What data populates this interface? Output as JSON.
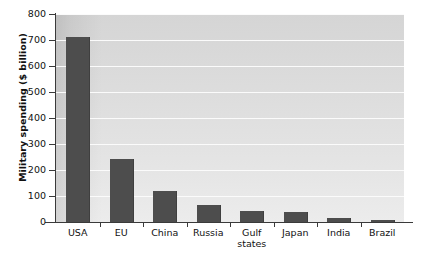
{
  "chart_data": {
    "type": "bar",
    "title": "",
    "xlabel": "",
    "ylabel": "Military spending ($ billion)",
    "categories": [
      "USA",
      "EU",
      "China",
      "Russia",
      "Gulf\nstates",
      "Japan",
      "India",
      "Brazil"
    ],
    "values": [
      710,
      242,
      120,
      65,
      43,
      38,
      15,
      8
    ],
    "ylim": [
      0,
      800
    ],
    "yticks": [
      0,
      100,
      200,
      300,
      400,
      500,
      600,
      700,
      800
    ],
    "ytick_labels": [
      "0",
      "100",
      "200",
      "300",
      "400",
      "500",
      "600",
      "700",
      "800"
    ],
    "grid": true,
    "grid_axis": "y",
    "legend": false,
    "legend_position": "none",
    "bar_color": "#4d4d4d",
    "plot_background": "#dcdcdc",
    "gridline_color": "#fbfbfb",
    "axis_color": "#3a3a3a"
  }
}
